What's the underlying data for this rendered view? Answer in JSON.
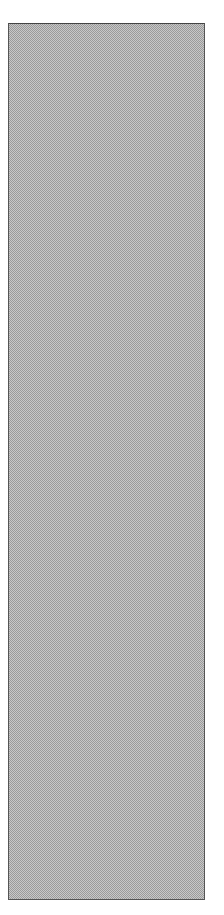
{
  "panel": {
    "fill": "dithered-gray",
    "colors": {
      "light": "#d8d8d8",
      "dark": "#9a9a9a",
      "border": "#555555"
    }
  }
}
